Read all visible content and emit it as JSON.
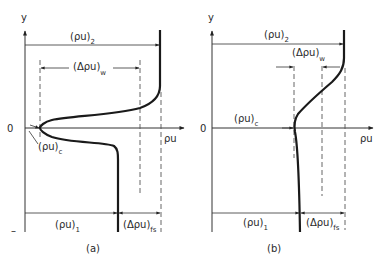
{
  "figure": {
    "panels": [
      {
        "id": "a",
        "caption": "(a)",
        "y_axis_label": "y",
        "x_axis_label": "ρu",
        "origin_label": "0",
        "bottom_tick_label": "–",
        "labels": {
          "rho_u_2": {
            "main": "(ρu)",
            "sub": "2"
          },
          "delta_rho_u_w": {
            "main": "(Δρu)",
            "sub": "w"
          },
          "rho_u_c": {
            "main": "(ρu)",
            "sub": "c"
          },
          "rho_u_1": {
            "main": "(ρu)",
            "sub": "1"
          },
          "delta_rho_u_fs": {
            "main": "(Δρu)",
            "sub": "fs"
          }
        }
      },
      {
        "id": "b",
        "caption": "(b)",
        "y_axis_label": "y",
        "x_axis_label": "ρu",
        "origin_label": "0",
        "labels": {
          "rho_u_2": {
            "main": "(ρu)",
            "sub": "2"
          },
          "delta_rho_u_w": {
            "main": "(Δρu)",
            "sub": "w"
          },
          "rho_u_c": {
            "main": "(ρu)",
            "sub": "c"
          },
          "rho_u_1": {
            "main": "(ρu)",
            "sub": "1"
          },
          "delta_rho_u_fs": {
            "main": "(Δρu)",
            "sub": "fs"
          }
        }
      }
    ]
  }
}
